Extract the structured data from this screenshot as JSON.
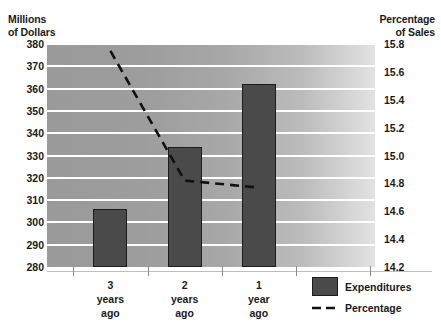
{
  "chart_data": {
    "type": "bar",
    "title": "",
    "subtitle": "",
    "xlabel": "",
    "ylabel": "Millions\nof Dollars",
    "y2label": "Percentage\nof Sales",
    "categories": [
      "3\nyears\nago",
      "2\nyears\nago",
      "1\nyear\nago"
    ],
    "grid": true,
    "legend_position": "bottom-right",
    "ylim": [
      280,
      380
    ],
    "yticks": [
      280,
      290,
      300,
      310,
      320,
      330,
      340,
      350,
      360,
      370,
      380
    ],
    "ytick_labels": [
      "280",
      "290",
      "300",
      "310",
      "320",
      "330",
      "340",
      "350",
      "360",
      "370",
      "380"
    ],
    "y2lim": [
      14.2,
      15.8
    ],
    "y2ticks": [
      14.2,
      14.4,
      14.6,
      14.8,
      15.0,
      15.2,
      15.4,
      15.6,
      15.8
    ],
    "y2tick_labels": [
      "14.2",
      "14.4",
      "14.6",
      "14.8",
      "15.0",
      "15.2",
      "15.4",
      "15.6",
      "15.8"
    ],
    "series": [
      {
        "name": "Expenditures",
        "type": "bar",
        "axis": "left",
        "color": "#4a4a4a",
        "values": [
          306,
          334,
          362
        ]
      },
      {
        "name": "Percentage",
        "type": "line",
        "axis": "right",
        "style": "dashed",
        "color": "#111111",
        "values": [
          15.75,
          14.82,
          14.77
        ]
      }
    ]
  },
  "legend": {
    "items": [
      {
        "label": "Expenditures",
        "marker": "filled-square"
      },
      {
        "label": "Percentage",
        "marker": "dashed-line"
      }
    ]
  }
}
